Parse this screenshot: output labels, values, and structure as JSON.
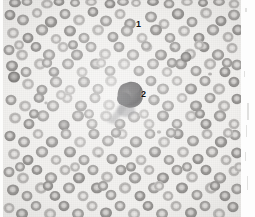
{
  "figure": {
    "kind": "photomicrograph",
    "modality": "light-microscopy",
    "color_mode": "grayscale",
    "background_color": "#f2f1ef",
    "plate_border_color": "#e6e5e3",
    "width_px": 255,
    "height_px": 217
  },
  "annotations": [
    {
      "id": "label-1",
      "text": "1",
      "x": 136,
      "y": 20,
      "refers_to": "erythrocyte",
      "color": "#111111"
    },
    {
      "id": "label-2",
      "text": "2",
      "x": 141,
      "y": 90,
      "refers_to": "leukocyte",
      "color": "#111111"
    }
  ],
  "features": {
    "erythrocytes": {
      "label": "1",
      "appearance": "pale gray biconcave discs with central pallor",
      "ring_color": "#a3a1a0",
      "center_color": "#e9e8e6",
      "approx_count": 260,
      "mean_diameter_px": 11
    },
    "leukocyte": {
      "label": "2",
      "appearance": "single large dark-stained nucleated white blood cell",
      "fill_color": "#3c3b3d",
      "center_x": 129,
      "center_y": 95,
      "width_px": 22,
      "height_px": 25
    }
  },
  "palette": {
    "paper": "#fdfdfc",
    "plate_background": "#f2f1ef",
    "cell_light": "#b4b2b0",
    "cell_mid": "#9b9997",
    "cell_dark": "#87857f",
    "nucleus_dark": "#3c3b3d",
    "annotation_text": "#111111",
    "margin_artifact": "#c9c8c6"
  },
  "margin": {
    "side": "right",
    "description": "blank scanned page margin with faint vertical scanner artifacts",
    "artifacts": [
      {
        "x": 4,
        "y": 8,
        "w": 2,
        "h": 4
      },
      {
        "x": 3,
        "y": 71,
        "w": 1,
        "h": 6
      },
      {
        "x": 6,
        "y": 103,
        "w": 2,
        "h": 17
      },
      {
        "x": 5,
        "y": 125,
        "w": 1,
        "h": 12
      },
      {
        "x": 4,
        "y": 152,
        "w": 1,
        "h": 9
      },
      {
        "x": 6,
        "y": 176,
        "w": 1,
        "h": 14
      }
    ]
  }
}
